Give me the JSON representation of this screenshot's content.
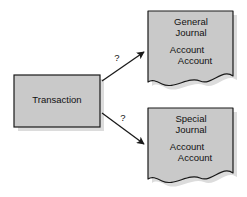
{
  "diagram": {
    "background_color": "#ffffff",
    "shape_fill": "#c9c9c9",
    "shape_stroke": "#1a1a1a",
    "shadow_color": "#d8d8d8",
    "text_color": "#111111",
    "nodes": {
      "transaction": {
        "label": "Transaction",
        "shape": "rectangle"
      },
      "general_journal": {
        "title_line1": "General",
        "title_line2": "Journal",
        "entry1": "Account",
        "entry2": "Account",
        "shape": "torn-page"
      },
      "special_journal": {
        "title_line1": "Special",
        "title_line2": "Journal",
        "entry1": "Account",
        "entry2": "Account",
        "shape": "torn-page"
      }
    },
    "connectors": [
      {
        "name": "transaction-to-general-journal",
        "label": "?",
        "direction": "up-right",
        "arrowhead": "filled"
      },
      {
        "name": "transaction-to-special-journal",
        "label": "?",
        "direction": "down-right",
        "arrowhead": "filled"
      }
    ]
  }
}
